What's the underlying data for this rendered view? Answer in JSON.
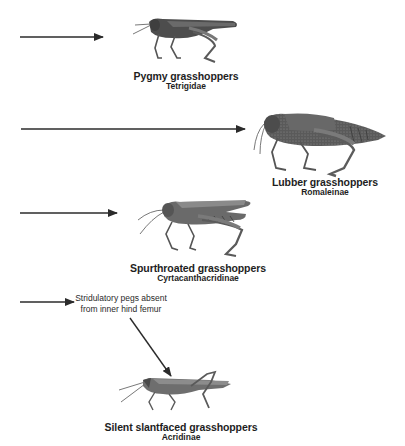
{
  "diagram": {
    "colors": {
      "arrow": "#2b2b2b",
      "insect_dark": "#4a4a4a",
      "insect_mid": "#7a7a7a",
      "insect_light": "#a8a8a8",
      "text": "#1e1e1e"
    },
    "nodes": [
      {
        "id": "pygmy",
        "common_name": "Pygmy grasshoppers",
        "scientific_name": "Tetrigidae",
        "icon": "grasshopper-illustration"
      },
      {
        "id": "lubber",
        "common_name": "Lubber grasshoppers",
        "scientific_name": "Romaleinae",
        "icon": "grasshopper-illustration"
      },
      {
        "id": "spurthroated",
        "common_name": "Spurthroated grasshoppers",
        "scientific_name": "Cyrtacanthacridinae",
        "icon": "grasshopper-illustration"
      },
      {
        "id": "silent-slantfaced",
        "common_name": "Silent slantfaced grasshoppers",
        "scientific_name": "Acridinae",
        "icon": "grasshopper-illustration"
      }
    ],
    "edges": [
      {
        "from": "left-branch-1",
        "to": "pygmy",
        "label": ""
      },
      {
        "from": "left-branch-2",
        "to": "lubber",
        "label": ""
      },
      {
        "from": "left-branch-3",
        "to": "spurthroated",
        "label": ""
      },
      {
        "from": "left-branch-4",
        "to": "silent-slantfaced",
        "label": "Stridulatory pegs absent from inner hind femur"
      }
    ],
    "annotation": {
      "line1": "Stridulatory pegs absent",
      "line2": "from inner hind femur"
    }
  }
}
